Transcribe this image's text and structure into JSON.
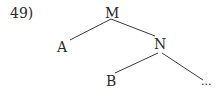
{
  "example": {
    "number": "49)"
  },
  "tree": {
    "nodes": {
      "root": "M",
      "left_child": "A",
      "right_child": "N",
      "n_left_child": "B",
      "n_right_child": "..."
    },
    "edges": [
      [
        "M",
        "A"
      ],
      [
        "M",
        "N"
      ],
      [
        "N",
        "B"
      ],
      [
        "N",
        "..."
      ]
    ]
  },
  "colors": {
    "line": "#3a3a3a",
    "text": "#2a2a2a",
    "background": "#ffffff"
  }
}
